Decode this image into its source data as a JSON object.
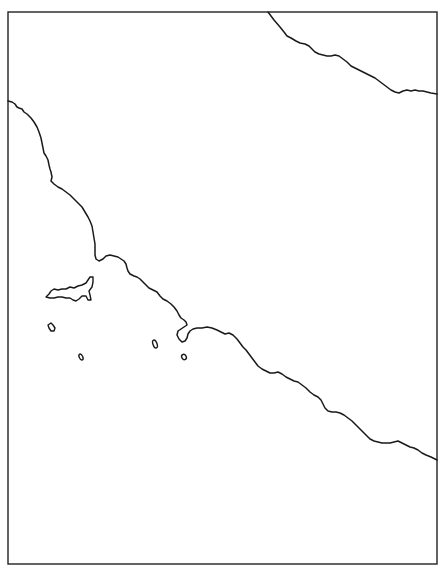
{
  "map": {
    "type": "outline-coastline-map",
    "background_color": "#ffffff",
    "line_color": "#1a1a1a",
    "frame": {
      "x": 8,
      "y": 12,
      "width": 429,
      "height": 552
    },
    "features": [
      {
        "name": "northeast-coastline",
        "kind": "coastline"
      },
      {
        "name": "main-coastline",
        "kind": "coastline"
      },
      {
        "name": "large-island",
        "kind": "island"
      },
      {
        "name": "small-island-1",
        "kind": "island"
      },
      {
        "name": "small-island-2",
        "kind": "island"
      },
      {
        "name": "small-island-3",
        "kind": "island"
      },
      {
        "name": "small-island-4",
        "kind": "island"
      }
    ]
  }
}
